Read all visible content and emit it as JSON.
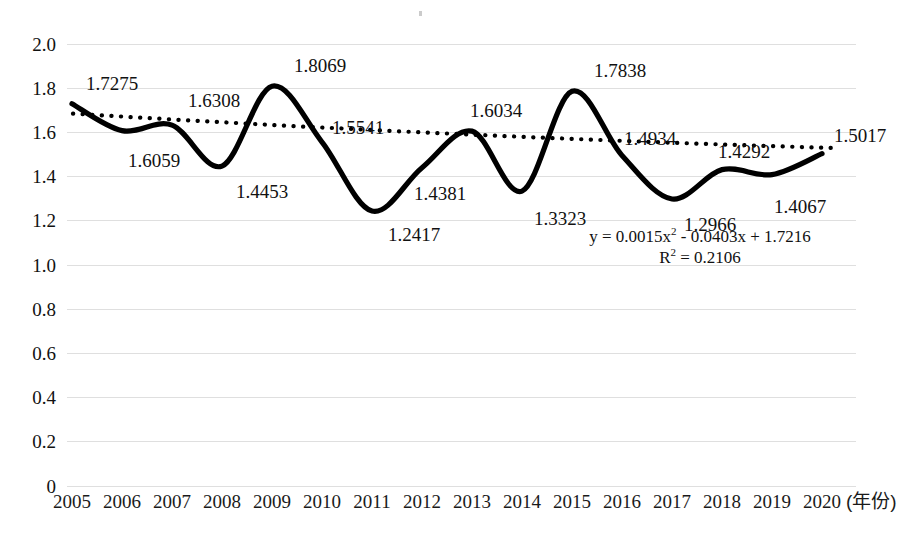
{
  "chart_data": {
    "type": "line",
    "title": "",
    "subtitle": "",
    "xlabel": "(年份)",
    "ylabel": "",
    "categories": [
      "2005",
      "2006",
      "2007",
      "2008",
      "2009",
      "2010",
      "2011",
      "2012",
      "2013",
      "2014",
      "2015",
      "2016",
      "2017",
      "2018",
      "2019",
      "2020"
    ],
    "values": [
      1.7275,
      1.6059,
      1.6308,
      1.4453,
      1.8069,
      1.5541,
      1.2417,
      1.4381,
      1.6034,
      1.3323,
      1.7838,
      1.4934,
      1.2966,
      1.4292,
      1.4067,
      1.5017
    ],
    "data_labels": [
      "1.7275",
      "1.6059",
      "1.6308",
      "1.4453",
      "1.8069",
      "1.5541",
      "1.2417",
      "1.4381",
      "1.6034",
      "1.3323",
      "1.7838",
      "1.4934",
      "1.2966",
      "1.4292",
      "1.4067",
      "1.5017"
    ],
    "ylim": [
      0,
      2.0
    ],
    "yticks": [
      "0",
      "0.2",
      "0.4",
      "0.6",
      "0.8",
      "1.0",
      "1.2",
      "1.4",
      "1.6",
      "1.8",
      "2.0"
    ],
    "ytick_values": [
      0,
      0.2,
      0.4,
      0.6,
      0.8,
      1.0,
      1.2,
      1.4,
      1.6,
      1.8,
      2.0
    ],
    "grid": true,
    "grid_color": "#d9d9d9",
    "legend": "none",
    "series": [
      {
        "name": "data-series",
        "style": "solid-smooth",
        "color": "#000000",
        "width": 5
      },
      {
        "name": "trendline",
        "style": "dotted",
        "color": "#000000",
        "width": 4,
        "fit": "polynomial-order-2",
        "equation": "y = 0.0015x² - 0.0403x + 1.7216",
        "r_squared": "R² = 0.2106",
        "endpoints": [
          1.6828,
          1.4832
        ]
      }
    ],
    "annotations": {
      "equation_line1_prefix": "y = 0.0015x",
      "equation_line1_sup": "2",
      "equation_line1_suffix": " - 0.0403x + 1.7216",
      "equation_line2_prefix": "R",
      "equation_line2_sup": "2",
      "equation_line2_suffix": " = 0.2106"
    }
  },
  "label_offsets": [
    {
      "dx": 14,
      "dy": -30
    },
    {
      "dx": 6,
      "dy": 20
    },
    {
      "dx": 16,
      "dy": -34
    },
    {
      "dx": 14,
      "dy": 16
    },
    {
      "dx": 22,
      "dy": -30
    },
    {
      "dx": 10,
      "dy": -24
    },
    {
      "dx": 16,
      "dy": 14
    },
    {
      "dx": -8,
      "dy": 16
    },
    {
      "dx": -2,
      "dy": -30
    },
    {
      "dx": 12,
      "dy": 18
    },
    {
      "dx": 22,
      "dy": -30
    },
    {
      "dx": 2,
      "dy": -26
    },
    {
      "dx": 12,
      "dy": 16
    },
    {
      "dx": -4,
      "dy": -28
    },
    {
      "dx": 2,
      "dy": 22
    },
    {
      "dx": 12,
      "dy": -28
    }
  ]
}
